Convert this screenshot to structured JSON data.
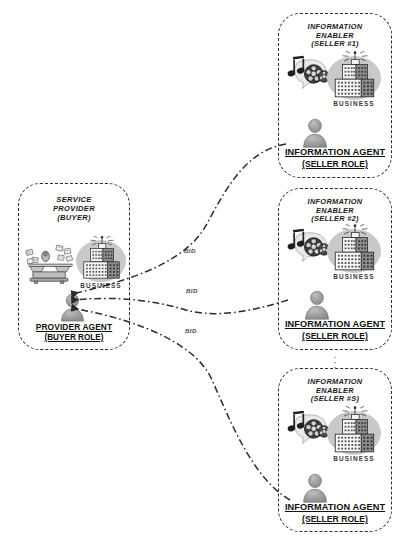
{
  "diagram": {
    "colors": {
      "stroke": "#2b2b2b",
      "ellipse_gray": "#c9c9c9",
      "person_gray": "#9a9a9a",
      "building_light": "#f2f2f2",
      "building_dark": "#8d8d8d",
      "text": "#111111"
    }
  },
  "buyer_box": {
    "title": "SERVICE\nPROVIDER\n(BUYER)",
    "business_label": "BUSINESS",
    "agent": {
      "line1": "PROVIDER AGENT",
      "line2": "(BUYER ROLE)"
    },
    "scale_icon_name": "balance-scale-icon",
    "building_icon_name": "business-building-icon",
    "person_icon_name": "provider-agent-person-icon"
  },
  "seller_boxes": [
    {
      "title": "INFORMATION\nENABLER\n(SELLER #1)",
      "business_label": "BUSINESS",
      "agent": {
        "line1": "INFORMATION AGENT",
        "line2": "(SELLER ROLE)"
      },
      "media_icon_name": "music-film-media-icon",
      "building_icon_name": "business-building-icon",
      "person_icon_name": "information-agent-person-icon"
    },
    {
      "title": "INFORMATION\nENABLER\n(SELLER #2)",
      "business_label": "BUSINESS",
      "agent": {
        "line1": "INFORMATION AGENT",
        "line2": "(SELLER ROLE)"
      },
      "media_icon_name": "music-film-media-icon",
      "building_icon_name": "business-building-icon",
      "person_icon_name": "information-agent-person-icon"
    },
    {
      "title": "INFORMATION\nENABLER\n(SELLER #S)",
      "business_label": "BUSINESS",
      "agent": {
        "line1": "INFORMATION AGENT",
        "line2": "(SELLER ROLE)"
      },
      "media_icon_name": "music-film-media-icon",
      "building_icon_name": "business-building-icon",
      "person_icon_name": "information-agent-person-icon"
    }
  ],
  "connectors": [
    {
      "label": "BID",
      "from": "seller-1-agent",
      "to": "provider-agent"
    },
    {
      "label": "BID",
      "from": "seller-2-agent",
      "to": "provider-agent"
    },
    {
      "label": "BID",
      "from": "seller-s-agent",
      "to": "provider-agent"
    }
  ],
  "continuation_marker": "⋮"
}
